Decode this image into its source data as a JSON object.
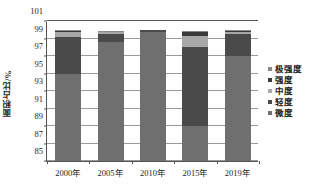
{
  "chart_data": {
    "type": "bar",
    "subtype": "stacked-column",
    "title": "",
    "xlabel": "",
    "ylabel": "面积占比/%",
    "ylim": [
      85,
      101
    ],
    "yticks": [
      85,
      87,
      89,
      91,
      93,
      95,
      97,
      99,
      101
    ],
    "grid": true,
    "legend_position": "right",
    "categories": [
      "2000年",
      "2005年",
      "2010年",
      "2015年",
      "2019年"
    ],
    "series": [
      {
        "name": "微度",
        "color": "#6f6f6f",
        "values": [
          10.0,
          13.6,
          14.8,
          4.0,
          12.0
        ]
      },
      {
        "name": "轻度",
        "color": "#4a4a4a",
        "values": [
          4.2,
          0.9,
          0.2,
          9.0,
          2.5
        ]
      },
      {
        "name": "中度",
        "color": "#a8a8a8",
        "values": [
          0.5,
          0.2,
          0.0,
          1.3,
          0.3
        ]
      },
      {
        "name": "强度",
        "color": "#3a3a3a",
        "values": [
          0.2,
          0.1,
          0.0,
          0.4,
          0.1
        ]
      },
      {
        "name": "极强度",
        "color": "#8a8a8a",
        "values": [
          0.1,
          0.1,
          0.0,
          0.2,
          0.1
        ]
      }
    ],
    "legend_order_top_to_bottom": [
      "极强度",
      "强度",
      "中度",
      "轻度",
      "微度"
    ],
    "axis_color": "#555555",
    "grid_color": "#9a9a9a"
  }
}
